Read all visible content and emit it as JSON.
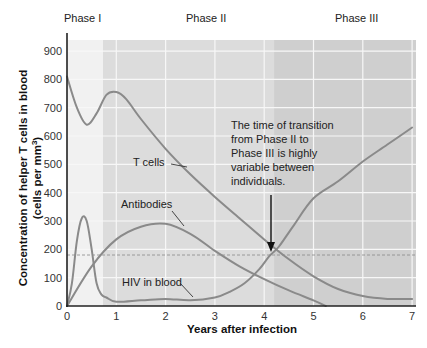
{
  "chart_data": {
    "type": "line",
    "title": "",
    "xlabel": "Years after infection",
    "ylabel": "Concentration of helper T cells in blood (cells per mm³)",
    "ylabel_line1": "Concentration of helper T cells in blood",
    "ylabel_line2": "(cells per mm",
    "ylabel_sup": "3",
    "ylabel_close": ")",
    "xlim": [
      0,
      7.1
    ],
    "ylim": [
      0,
      960
    ],
    "x_ticks": [
      "0",
      "1",
      "2",
      "3",
      "4",
      "5",
      "6",
      "7"
    ],
    "y_ticks": [
      "0",
      "100",
      "200",
      "300",
      "400",
      "500",
      "600",
      "700",
      "800",
      "900"
    ],
    "grid": true,
    "phases": [
      {
        "name": "Phase I",
        "x_start": 0,
        "x_end": 0.73,
        "color": "#f1f1f1"
      },
      {
        "name": "Phase II",
        "x_start": 0.73,
        "x_end": 4.2,
        "color": "#dcdcdc"
      },
      {
        "name": "Phase III",
        "x_start": 4.2,
        "x_end": 7.1,
        "color": "#cfcfcf"
      }
    ],
    "threshold_line": {
      "y": 180,
      "style": "dashed"
    },
    "series": [
      {
        "name": "T cells",
        "x": [
          0,
          0.2,
          0.4,
          0.6,
          0.8,
          1.0,
          1.2,
          1.5,
          2.0,
          2.5,
          3.0,
          3.5,
          4.0,
          4.5,
          5.0,
          5.5,
          6.0,
          6.5,
          7.0
        ],
        "values": [
          810,
          700,
          640,
          680,
          745,
          755,
          730,
          660,
          555,
          465,
          385,
          310,
          235,
          165,
          105,
          60,
          35,
          25,
          25
        ]
      },
      {
        "name": "Antibodies",
        "x": [
          0,
          0.5,
          1.0,
          1.5,
          2.0,
          2.5,
          3.0,
          3.5,
          4.0,
          4.5,
          5.0,
          5.25
        ],
        "values": [
          0,
          140,
          235,
          280,
          290,
          255,
          195,
          140,
          95,
          55,
          20,
          0
        ]
      },
      {
        "name": "HIV in blood",
        "x": [
          0,
          0.1,
          0.2,
          0.3,
          0.4,
          0.5,
          0.6,
          0.7,
          0.8,
          1.0,
          1.5,
          2.0,
          2.5,
          3.0,
          3.3,
          3.6,
          3.9,
          4.1,
          4.3,
          4.6,
          5.0,
          5.5,
          6.0,
          6.5,
          7.0
        ],
        "values": [
          0,
          80,
          230,
          310,
          300,
          200,
          80,
          40,
          30,
          15,
          20,
          25,
          20,
          30,
          50,
          80,
          130,
          175,
          210,
          285,
          380,
          440,
          510,
          570,
          630
        ]
      }
    ],
    "annotations": [
      {
        "text": "T cells",
        "points_to": "T cells"
      },
      {
        "text": "Antibodies",
        "points_to": "Antibodies"
      },
      {
        "text": "HIV in blood",
        "points_to": "HIV in blood"
      },
      {
        "text": "The time of transition from Phase II to Phase III is highly variable between individuals.",
        "arrow_to": {
          "x": 4.2,
          "y": 180
        }
      }
    ],
    "annotation_lines": [
      "The time of transition",
      "from Phase II to",
      "Phase III is highly",
      "variable between",
      "individuals."
    ],
    "colors": {
      "curve": "#8a8a8a",
      "axis": "#222222",
      "grid": "#f7f7f7",
      "dashed": "#888888",
      "arrow": "#111111"
    }
  }
}
